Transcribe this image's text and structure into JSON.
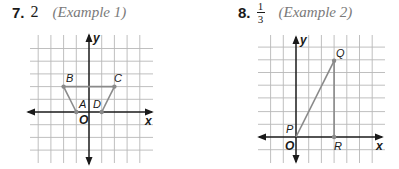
{
  "problems": [
    {
      "number": "7.",
      "answer": "2",
      "reference": "(Example 1)",
      "graph": {
        "x_axis_label": "x",
        "y_axis_label": "y",
        "origin_label": "O",
        "points": [
          {
            "name": "A",
            "x": -1,
            "y": 0
          },
          {
            "name": "B",
            "x": -2,
            "y": 2
          },
          {
            "name": "C",
            "x": 2,
            "y": 2
          },
          {
            "name": "D",
            "x": 1,
            "y": 0
          }
        ],
        "segments": [
          [
            "A",
            "B"
          ],
          [
            "B",
            "C"
          ],
          [
            "C",
            "D"
          ]
        ]
      }
    },
    {
      "number": "8.",
      "answer_numerator": "1",
      "answer_denominator": "3",
      "reference": "(Example 2)",
      "graph": {
        "x_axis_label": "x",
        "y_axis_label": "y",
        "origin_label": "O",
        "points": [
          {
            "name": "P",
            "x": 0,
            "y": 0
          },
          {
            "name": "Q",
            "x": 3,
            "y": 6
          },
          {
            "name": "R",
            "x": 3,
            "y": 0
          }
        ],
        "segments": [
          [
            "P",
            "Q"
          ],
          [
            "Q",
            "R"
          ]
        ]
      }
    }
  ]
}
